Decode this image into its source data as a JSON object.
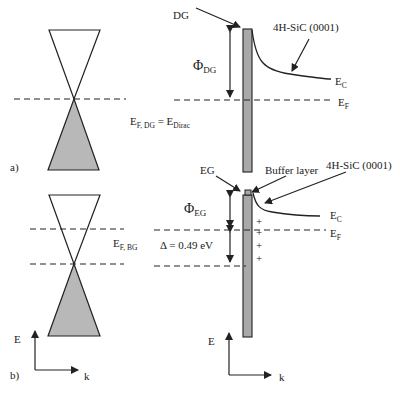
{
  "colors": {
    "line": "#222222",
    "fill_valence": "#b8b8b8",
    "bar_fill": "#a9a9a9"
  },
  "panel_a": {
    "tag": "a)",
    "fermi_label_main": "E",
    "fermi_label_sub": "F, DG",
    "fermi_eq": " = E",
    "fermi_eq_sub": "Dirac",
    "graphene_label": "DG",
    "phi_main": "Φ",
    "phi_sub": "DG",
    "substrate_label": "4H-SiC (0001)",
    "ec_main": "E",
    "ec_sub": "C",
    "ef_main": "E",
    "ef_sub": "F"
  },
  "panel_b": {
    "tag": "b)",
    "fermi_label_main": "E",
    "fermi_label_sub": "F, BG",
    "delta_label": "Δ = 0.49 eV",
    "graphene_label": "EG",
    "buffer_label": "Buffer layer",
    "phi_main": "Φ",
    "phi_sub": "EG",
    "substrate_label": "4H-SiC (0001)",
    "ec_main": "E",
    "ec_sub": "C",
    "ef_main": "E",
    "ef_sub": "F",
    "charges": [
      "+",
      "+",
      "+",
      "+"
    ],
    "axis_left": {
      "y_label": "E",
      "x_label": "k"
    },
    "axis_right": {
      "y_label": "E",
      "x_label": "k"
    }
  }
}
